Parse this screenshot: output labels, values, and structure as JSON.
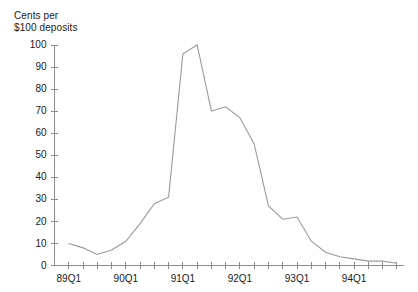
{
  "chart_data": {
    "type": "line",
    "title": "",
    "ylabel": "Cents per\n$100 deposits",
    "xlabel": "",
    "ylim": [
      0,
      100
    ],
    "yticks": [
      0,
      10,
      20,
      30,
      40,
      50,
      60,
      70,
      80,
      90,
      100
    ],
    "ytick_labels": [
      "0",
      "10",
      "20",
      "30",
      "40",
      "50",
      "60",
      "70",
      "80",
      "90",
      "100"
    ],
    "grid": false,
    "legend": false,
    "legend_position": "none",
    "line_color": "#9a9a9a",
    "axis_color": "#8c8c8c",
    "x": [
      "89Q1",
      "89Q2",
      "89Q3",
      "89Q4",
      "90Q1",
      "90Q2",
      "90Q3",
      "90Q4",
      "91Q1",
      "91Q2",
      "91Q3",
      "91Q4",
      "92Q1",
      "92Q2",
      "92Q3",
      "92Q4",
      "93Q1",
      "93Q2",
      "93Q3",
      "93Q4",
      "94Q1",
      "94Q2",
      "94Q3",
      "94Q4"
    ],
    "xtick_labels": [
      "89Q1",
      "90Q1",
      "91Q1",
      "92Q1",
      "93Q1",
      "94Q1"
    ],
    "xtick_label_indices": [
      0,
      4,
      8,
      12,
      16,
      20
    ],
    "values": [
      10,
      8,
      5,
      7,
      11,
      19,
      28,
      31,
      96,
      100,
      70,
      72,
      67,
      55,
      27,
      21,
      22,
      11,
      6,
      4,
      3,
      2,
      2,
      1
    ],
    "series": [
      {
        "name": "Cents per $100 deposits",
        "values": [
          10,
          8,
          5,
          7,
          11,
          19,
          28,
          31,
          96,
          100,
          70,
          72,
          67,
          55,
          27,
          21,
          22,
          11,
          6,
          4,
          3,
          2,
          2,
          1
        ]
      }
    ]
  }
}
